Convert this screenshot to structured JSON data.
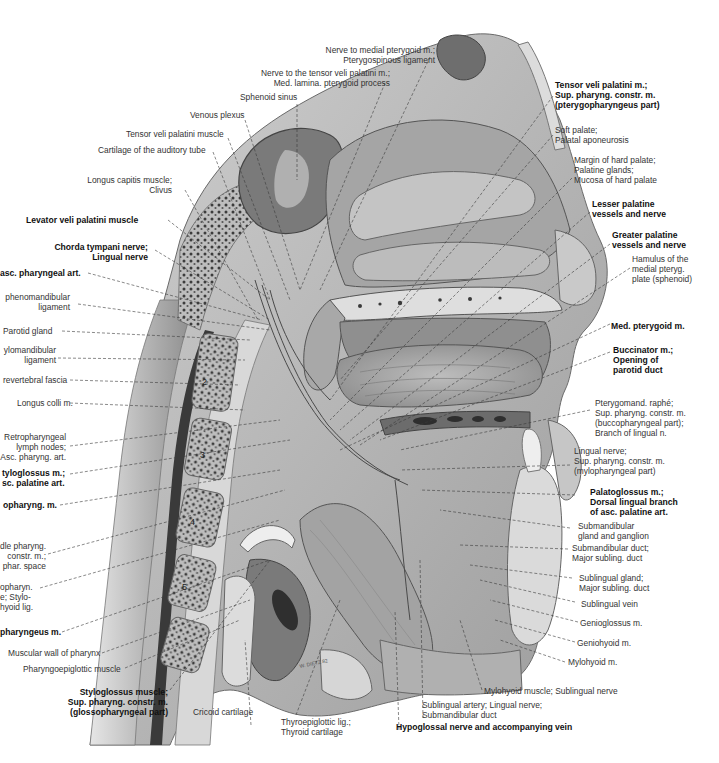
{
  "figure": {
    "artist_signature": "W. DIETZ 82",
    "vertebra_numbers": [
      "2",
      "3",
      "4",
      "5"
    ],
    "colors": {
      "background": "#ffffff",
      "bone": "#d9d9d9",
      "bone_dark": "#8a8a8a",
      "soft_tissue": "#bfbfbf",
      "cavity": "#9a9a9a",
      "shadow": "#4a4a4a",
      "label_text": "#333333",
      "bold_label_text": "#111111",
      "leader_line": "#3a3a3a"
    }
  },
  "labels": {
    "top": [
      {
        "id": "nerve-medial-pterygoid",
        "lines": [
          "Nerve to medial pterygoid m.;",
          "Pterygospinous ligament"
        ],
        "bold": false
      },
      {
        "id": "nerve-tensor-veli",
        "lines": [
          "Nerve to the tensor veli palatini m.;",
          "Med. lamina. pterygoid process"
        ],
        "bold": false
      },
      {
        "id": "sphenoid-sinus",
        "lines": [
          "Sphenoid sinus"
        ],
        "bold": false
      },
      {
        "id": "venous-plexus",
        "lines": [
          "Venous plexus"
        ],
        "bold": false
      },
      {
        "id": "tensor-veli-muscle",
        "lines": [
          "Tensor veli palatini muscle"
        ],
        "bold": false
      },
      {
        "id": "cartilage-auditory-tube",
        "lines": [
          "Cartilage of the auditory tube"
        ],
        "bold": false
      },
      {
        "id": "longus-capitis",
        "lines": [
          "Longus capitis muscle;",
          "Clivus"
        ],
        "bold": false
      }
    ],
    "left": [
      {
        "id": "levator-veli",
        "lines": [
          "Levator veli palatini muscle"
        ],
        "bold": true
      },
      {
        "id": "chorda-tympani",
        "lines": [
          "Chorda tympani nerve;",
          "Lingual nerve"
        ],
        "bold": true
      },
      {
        "id": "asc-pharyngeal-art",
        "lines": [
          "asc. pharyngeal art."
        ],
        "bold": true
      },
      {
        "id": "sphenomandibular",
        "lines": [
          "phenomandibular",
          "ligament"
        ],
        "bold": false
      },
      {
        "id": "parotid-gland",
        "lines": [
          "Parotid gland"
        ],
        "bold": false
      },
      {
        "id": "stylomandibular",
        "lines": [
          "ylomandibular",
          "ligament"
        ],
        "bold": false
      },
      {
        "id": "prevertebral-fascia",
        "lines": [
          "revertebral  fascia"
        ],
        "bold": false
      },
      {
        "id": "longus-colli",
        "lines": [
          "Longus colli m."
        ],
        "bold": false
      },
      {
        "id": "retropharyngeal-nodes",
        "lines": [
          "Retropharyngeal",
          "lymph nodes;",
          "Asc. pharyng. art."
        ],
        "bold": false
      },
      {
        "id": "styloglossus-asc-palatine",
        "lines": [
          "tyloglossus m.;",
          "sc. palatine art."
        ],
        "bold": true
      },
      {
        "id": "stylopharyngeus",
        "lines": [
          "opharyng. m."
        ],
        "bold": true
      },
      {
        "id": "middle-pharyng-constr",
        "lines": [
          "dle pharyng.",
          "constr. m.;",
          "phar. space"
        ],
        "bold": false
      },
      {
        "id": "stylohyoid-lig",
        "lines": [
          "opharyn.",
          "e; Stylo-",
          "hyoid lig."
        ],
        "bold": false
      },
      {
        "id": "palatopharyngeus",
        "lines": [
          "pharyngeus m."
        ],
        "bold": true
      },
      {
        "id": "muscular-wall-pharynx",
        "lines": [
          "Muscular wall of pharynx"
        ],
        "bold": false
      },
      {
        "id": "pharyngoepiglottic",
        "lines": [
          "Pharyngoepiglottic muscle"
        ],
        "bold": false
      }
    ],
    "bottom": [
      {
        "id": "styloglossus-glossopharyngeal",
        "lines": [
          "Styloglossus muscle;",
          "Sup. pharyng. constr. m.",
          "(glossopharyngeal part)"
        ],
        "bold": true
      },
      {
        "id": "cricoid-cartilage",
        "lines": [
          "Cricoid cartilage"
        ],
        "bold": false
      },
      {
        "id": "thyroepiglottic",
        "lines": [
          "Thyroepiglottic lig.;",
          "Thyroid cartilage"
        ],
        "bold": false
      },
      {
        "id": "hypoglossal-nerve",
        "lines": [
          "Hypoglossal nerve and accompanying vein"
        ],
        "bold": true
      },
      {
        "id": "sublingual-artery",
        "lines": [
          "Sublingual artery; Lingual nerve;",
          "Submandibular duct"
        ],
        "bold": false
      },
      {
        "id": "mylohyoid-sublingual-nerve",
        "lines": [
          "Mylohyoid muscle; Sublingual nerve"
        ],
        "bold": false
      }
    ],
    "right": [
      {
        "id": "tensor-veli-sup-constr",
        "lines": [
          "Tensor veli palatini m.;",
          "Sup. pharyng. constr. m.",
          "(pterygopharyngeus part)"
        ],
        "bold": true
      },
      {
        "id": "soft-palate",
        "lines": [
          "Soft palate;",
          "Palatal aponeurosis"
        ],
        "bold": false
      },
      {
        "id": "margin-hard-palate",
        "lines": [
          "Margin of hard palate;",
          "Palatine glands;",
          "Mucosa of hard palate"
        ],
        "bold": false
      },
      {
        "id": "lesser-palatine",
        "lines": [
          "Lesser palatine",
          "vessels and nerve"
        ],
        "bold": true
      },
      {
        "id": "greater-palatine",
        "lines": [
          "Greater palatine",
          "vessels and nerve"
        ],
        "bold": true
      },
      {
        "id": "hamulus",
        "lines": [
          "Hamulus of the",
          "medial pteryg.",
          "plate (sphenoid)"
        ],
        "bold": false
      },
      {
        "id": "med-pterygoid",
        "lines": [
          "Med. pterygoid m."
        ],
        "bold": true
      },
      {
        "id": "buccinator",
        "lines": [
          "Buccinator m.;",
          "Opening of",
          "parotid duct"
        ],
        "bold": true
      },
      {
        "id": "pterygomand-raphe",
        "lines": [
          "Pterygomand. raphé;",
          "Sup. pharyng. constr. m.",
          "(buccopharyngeal part);",
          "Branch of lingual n."
        ],
        "bold": false
      },
      {
        "id": "lingual-nerve-mylo",
        "lines": [
          "Lingual nerve;",
          "Sup. pharyng. constr. m.",
          "(mylopharyngeal part)"
        ],
        "bold": false
      },
      {
        "id": "palatoglossus",
        "lines": [
          "Palatoglossus m.;",
          "Dorsal lingual branch",
          "of asc. palatine art."
        ],
        "bold": true
      },
      {
        "id": "submandibular-gland",
        "lines": [
          "Submandibular",
          "gland and ganglion"
        ],
        "bold": false
      },
      {
        "id": "submandibular-duct",
        "lines": [
          "Submandibular duct;",
          "Major subling. duct"
        ],
        "bold": false
      },
      {
        "id": "sublingual-gland",
        "lines": [
          "Sublingual gland;",
          "Major subling. duct"
        ],
        "bold": false
      },
      {
        "id": "sublingual-vein",
        "lines": [
          "Sublingual vein"
        ],
        "bold": false
      },
      {
        "id": "genioglossus",
        "lines": [
          "Genioglossus m."
        ],
        "bold": false
      },
      {
        "id": "geniohyoid",
        "lines": [
          "Geniohyoid m."
        ],
        "bold": false
      },
      {
        "id": "mylohyoid",
        "lines": [
          "Mylohyoid m."
        ],
        "bold": false
      }
    ]
  }
}
